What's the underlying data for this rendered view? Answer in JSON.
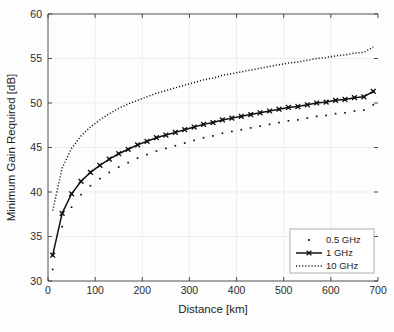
{
  "chart_data": {
    "type": "line",
    "title": "",
    "xlabel": "Distance [km]",
    "ylabel": "Minimum Gain Required [dB]",
    "xlim": [
      0,
      700
    ],
    "ylim": [
      30,
      60
    ],
    "xticks": [
      0,
      100,
      200,
      300,
      400,
      500,
      600,
      700
    ],
    "yticks": [
      30,
      35,
      40,
      45,
      50,
      55,
      60
    ],
    "grid": true,
    "legend_position": "lower right",
    "legend_entries": [
      "0.5 GHz",
      "1 GHz",
      "10 GHz"
    ],
    "x": [
      10,
      30,
      50,
      70,
      90,
      110,
      130,
      150,
      170,
      190,
      210,
      230,
      250,
      270,
      290,
      310,
      330,
      350,
      370,
      390,
      410,
      430,
      450,
      470,
      490,
      510,
      530,
      550,
      570,
      590,
      610,
      630,
      650,
      670,
      690
    ],
    "series": [
      {
        "name": "0.5 GHz",
        "style": "dotted-markers",
        "marker": "dot",
        "values": [
          31.3,
          36.1,
          38.3,
          39.7,
          40.7,
          41.5,
          42.2,
          42.8,
          43.3,
          43.8,
          44.2,
          44.6,
          44.9,
          45.2,
          45.5,
          45.8,
          46.1,
          46.3,
          46.6,
          46.8,
          47.0,
          47.2,
          47.4,
          47.6,
          47.8,
          48.0,
          48.1,
          48.3,
          48.5,
          48.6,
          48.8,
          48.9,
          49.1,
          49.2,
          49.8
        ]
      },
      {
        "name": "1 GHz",
        "style": "solid-markers",
        "marker": "x-square",
        "values": [
          32.9,
          37.6,
          39.8,
          41.2,
          42.2,
          43.0,
          43.7,
          44.3,
          44.8,
          45.3,
          45.7,
          46.1,
          46.4,
          46.7,
          47.0,
          47.3,
          47.6,
          47.8,
          48.1,
          48.3,
          48.5,
          48.7,
          48.9,
          49.1,
          49.3,
          49.5,
          49.6,
          49.8,
          50.0,
          50.1,
          50.3,
          50.4,
          50.6,
          50.7,
          51.3
        ]
      },
      {
        "name": "10 GHz",
        "style": "dotted",
        "marker": "none",
        "values": [
          37.9,
          42.7,
          44.9,
          46.3,
          47.3,
          48.1,
          48.8,
          49.4,
          49.9,
          50.3,
          50.7,
          51.1,
          51.4,
          51.7,
          52.0,
          52.3,
          52.6,
          52.8,
          53.1,
          53.3,
          53.5,
          53.7,
          53.9,
          54.1,
          54.3,
          54.5,
          54.6,
          54.8,
          55.0,
          55.1,
          55.3,
          55.4,
          55.6,
          55.7,
          56.3
        ]
      }
    ]
  },
  "axes": {
    "xtick_labels": [
      "0",
      "100",
      "200",
      "300",
      "400",
      "500",
      "600",
      "700"
    ],
    "ytick_labels": [
      "30",
      "35",
      "40",
      "45",
      "50",
      "55",
      "60"
    ],
    "xlabel": "Distance [km]",
    "ylabel": "Minimum Gain Required [dB]"
  },
  "legend": {
    "items": [
      {
        "label": "0.5 GHz",
        "style": "dot"
      },
      {
        "label": "1 GHz",
        "style": "solid-marker"
      },
      {
        "label": "10 GHz",
        "style": "dotted"
      }
    ]
  },
  "colors": {
    "series": "#111111",
    "grid": "#e6e6e6",
    "axis": "#3a3a3a",
    "background": "#fdfdfd"
  }
}
